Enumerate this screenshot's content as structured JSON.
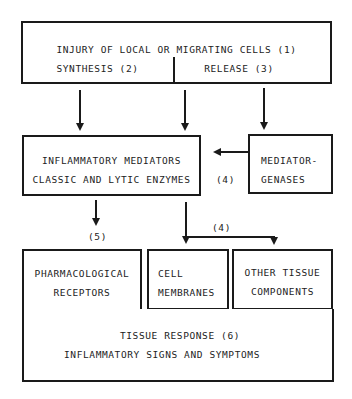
{
  "diagram": {
    "top_box": {
      "line1": "INJURY  OF  LOCAL  OR  MIGRATING  CELLS  (1)",
      "left_label": "SYNTHESIS (2)",
      "right_label": "RELEASE (3)"
    },
    "mediators_box": {
      "line1": "INFLAMMATORY MEDIATORS",
      "line2": "CLASSIC AND LYTIC ENZYMES"
    },
    "genases_box": {
      "line1": "MEDIATOR-",
      "line2": "GENASES"
    },
    "labels": {
      "genases_arrow": "(4)",
      "receptor_arrow": "(5)",
      "membrane_arrow": "(4)"
    },
    "receptors_box": {
      "line1": "PHARMACOLOGICAL",
      "line2": "RECEPTORS"
    },
    "membranes_box": {
      "line1": "CELL",
      "line2": "MEMBRANES"
    },
    "other_box": {
      "line1": "OTHER TISSUE",
      "line2": "COMPONENTS"
    },
    "response_box": {
      "line1": "TISSUE RESPONSE    (6)",
      "line2": "INFLAMMATORY SIGNS  AND SYMPTOMS"
    }
  }
}
